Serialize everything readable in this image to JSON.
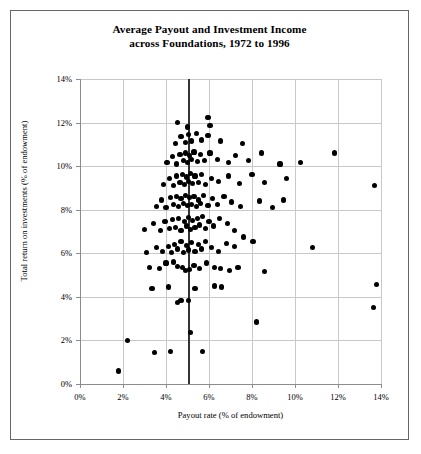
{
  "figure": {
    "title_line1": "Average Payout and Investment Income",
    "title_line2": "across Foundations, 1972 to 1996",
    "border_color": "#666666",
    "background": "#ffffff"
  },
  "chart_data": {
    "type": "scatter",
    "title": "Average Payout and Investment Income across Foundations, 1972 to 1996",
    "xlabel": "Payout rate (% of endowment)",
    "ylabel": "Total return on investments (% of endowment)",
    "xlim": [
      0,
      14
    ],
    "ylim": [
      0,
      14
    ],
    "xticks": [
      0,
      2,
      4,
      6,
      8,
      10,
      12,
      14
    ],
    "yticks": [
      0,
      2,
      4,
      6,
      8,
      10,
      12,
      14
    ],
    "xticklabels": [
      "0%",
      "2%",
      "4%",
      "6%",
      "8%",
      "10%",
      "12%",
      "14%"
    ],
    "yticklabels": [
      "0%",
      "2%",
      "4%",
      "6%",
      "8%",
      "10%",
      "12%",
      "14%"
    ],
    "grid": true,
    "grid_color": "#c8c8c8",
    "legend": null,
    "marker": "filled-circle",
    "marker_color": "#000000",
    "marker_size": 5.2,
    "reference_line": {
      "orientation": "vertical",
      "x": 5.0,
      "color": "#333333",
      "width": 2,
      "note": "5% minimum payout rate"
    },
    "points": [
      [
        1.8,
        0.6
      ],
      [
        2.2,
        2.0
      ],
      [
        3.45,
        1.45
      ],
      [
        4.2,
        1.5
      ],
      [
        5.15,
        2.35
      ],
      [
        5.7,
        1.5
      ],
      [
        8.2,
        2.85
      ],
      [
        13.65,
        3.5
      ],
      [
        13.8,
        4.55
      ],
      [
        3.35,
        4.4
      ],
      [
        4.55,
        3.75
      ],
      [
        4.7,
        3.85
      ],
      [
        5.05,
        3.85
      ],
      [
        4.1,
        4.45
      ],
      [
        5.35,
        4.4
      ],
      [
        6.25,
        4.5
      ],
      [
        6.6,
        4.45
      ],
      [
        3.25,
        5.35
      ],
      [
        3.7,
        5.3
      ],
      [
        4.0,
        5.55
      ],
      [
        4.35,
        5.6
      ],
      [
        4.55,
        5.4
      ],
      [
        4.75,
        5.35
      ],
      [
        4.9,
        5.2
      ],
      [
        5.1,
        5.25
      ],
      [
        5.3,
        5.45
      ],
      [
        5.55,
        5.3
      ],
      [
        5.9,
        5.55
      ],
      [
        6.25,
        5.35
      ],
      [
        6.55,
        5.3
      ],
      [
        6.95,
        5.2
      ],
      [
        7.35,
        5.35
      ],
      [
        8.6,
        5.15
      ],
      [
        3.1,
        6.05
      ],
      [
        3.55,
        6.25
      ],
      [
        3.85,
        6.1
      ],
      [
        4.1,
        6.3
      ],
      [
        4.25,
        6.05
      ],
      [
        4.4,
        6.4
      ],
      [
        4.55,
        6.2
      ],
      [
        4.7,
        6.55
      ],
      [
        4.8,
        6.05
      ],
      [
        4.95,
        6.35
      ],
      [
        5.05,
        6.15
      ],
      [
        5.2,
        6.5
      ],
      [
        5.35,
        6.1
      ],
      [
        5.5,
        6.4
      ],
      [
        5.65,
        6.2
      ],
      [
        5.85,
        6.55
      ],
      [
        6.1,
        6.25
      ],
      [
        6.45,
        6.1
      ],
      [
        6.8,
        6.45
      ],
      [
        7.2,
        6.3
      ],
      [
        7.6,
        6.75
      ],
      [
        8.05,
        6.55
      ],
      [
        10.8,
        6.25
      ],
      [
        3.0,
        7.1
      ],
      [
        3.4,
        7.35
      ],
      [
        3.75,
        7.05
      ],
      [
        3.95,
        7.45
      ],
      [
        4.15,
        7.15
      ],
      [
        4.3,
        7.55
      ],
      [
        4.45,
        7.2
      ],
      [
        4.6,
        7.6
      ],
      [
        4.7,
        7.05
      ],
      [
        4.85,
        7.45
      ],
      [
        4.95,
        7.25
      ],
      [
        5.05,
        7.65
      ],
      [
        5.15,
        7.1
      ],
      [
        5.25,
        7.5
      ],
      [
        5.35,
        7.2
      ],
      [
        5.45,
        7.6
      ],
      [
        5.55,
        7.3
      ],
      [
        5.7,
        7.7
      ],
      [
        5.85,
        7.15
      ],
      [
        6.0,
        7.45
      ],
      [
        6.2,
        7.25
      ],
      [
        6.5,
        7.6
      ],
      [
        6.85,
        7.35
      ],
      [
        7.2,
        7.05
      ],
      [
        3.55,
        8.15
      ],
      [
        3.8,
        8.45
      ],
      [
        4.0,
        8.1
      ],
      [
        4.2,
        8.55
      ],
      [
        4.35,
        8.25
      ],
      [
        4.5,
        8.6
      ],
      [
        4.6,
        8.15
      ],
      [
        4.7,
        8.5
      ],
      [
        4.8,
        8.3
      ],
      [
        4.9,
        8.65
      ],
      [
        5.0,
        8.2
      ],
      [
        5.1,
        8.55
      ],
      [
        5.2,
        8.25
      ],
      [
        5.3,
        8.6
      ],
      [
        5.4,
        8.15
      ],
      [
        5.5,
        8.45
      ],
      [
        5.6,
        8.3
      ],
      [
        5.75,
        8.65
      ],
      [
        5.95,
        8.2
      ],
      [
        6.15,
        8.5
      ],
      [
        6.4,
        8.25
      ],
      [
        6.7,
        8.6
      ],
      [
        7.05,
        8.35
      ],
      [
        7.45,
        8.15
      ],
      [
        8.35,
        8.4
      ],
      [
        8.95,
        8.1
      ],
      [
        9.45,
        8.45
      ],
      [
        13.7,
        9.1
      ],
      [
        3.9,
        9.15
      ],
      [
        4.15,
        9.45
      ],
      [
        4.35,
        9.1
      ],
      [
        4.5,
        9.55
      ],
      [
        4.65,
        9.25
      ],
      [
        4.75,
        9.6
      ],
      [
        4.85,
        9.15
      ],
      [
        4.95,
        9.5
      ],
      [
        5.05,
        9.3
      ],
      [
        5.15,
        9.65
      ],
      [
        5.25,
        9.2
      ],
      [
        5.35,
        9.55
      ],
      [
        5.5,
        9.25
      ],
      [
        5.65,
        9.6
      ],
      [
        5.85,
        9.15
      ],
      [
        6.1,
        9.45
      ],
      [
        6.45,
        9.3
      ],
      [
        6.9,
        9.55
      ],
      [
        7.4,
        9.2
      ],
      [
        8.0,
        9.6
      ],
      [
        8.6,
        9.25
      ],
      [
        9.6,
        9.45
      ],
      [
        4.05,
        10.15
      ],
      [
        4.3,
        10.45
      ],
      [
        4.5,
        10.1
      ],
      [
        4.65,
        10.55
      ],
      [
        4.8,
        10.25
      ],
      [
        4.9,
        10.6
      ],
      [
        5.0,
        10.15
      ],
      [
        5.1,
        10.5
      ],
      [
        5.2,
        10.3
      ],
      [
        5.3,
        10.65
      ],
      [
        5.45,
        10.2
      ],
      [
        5.6,
        10.55
      ],
      [
        5.8,
        10.25
      ],
      [
        6.05,
        10.6
      ],
      [
        6.4,
        10.3
      ],
      [
        6.9,
        10.15
      ],
      [
        7.25,
        10.5
      ],
      [
        7.85,
        10.25
      ],
      [
        8.45,
        10.6
      ],
      [
        9.3,
        10.1
      ],
      [
        10.25,
        10.15
      ],
      [
        11.85,
        10.6
      ],
      [
        4.45,
        11.05
      ],
      [
        4.7,
        11.35
      ],
      [
        4.9,
        11.1
      ],
      [
        5.05,
        11.45
      ],
      [
        5.2,
        11.15
      ],
      [
        5.4,
        11.5
      ],
      [
        5.65,
        11.2
      ],
      [
        5.95,
        11.4
      ],
      [
        6.55,
        11.15
      ],
      [
        7.55,
        11.05
      ],
      [
        4.55,
        12.0
      ],
      [
        5.0,
        11.8
      ],
      [
        5.95,
        12.25
      ],
      [
        6.05,
        11.85
      ]
    ]
  }
}
